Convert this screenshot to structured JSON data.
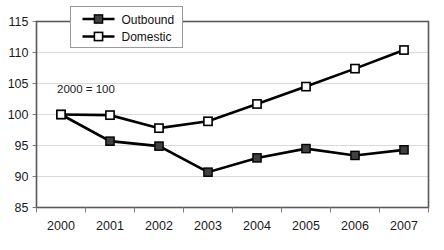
{
  "chart_data": {
    "type": "line",
    "title": "",
    "xlabel": "",
    "ylabel": "",
    "categories": [
      "2000",
      "2001",
      "2002",
      "2003",
      "2004",
      "2005",
      "2006",
      "2007"
    ],
    "ylim": [
      85,
      115
    ],
    "y_ticks": [
      85,
      90,
      95,
      100,
      105,
      110,
      115
    ],
    "y_tick_labels": [
      "85",
      "90",
      "95",
      "100",
      "105",
      "110",
      "115"
    ],
    "grid": true,
    "legend_position": "top-center",
    "annotations": [
      {
        "text": "2000 = 100",
        "x_value": "2000",
        "y_value": 103.5
      }
    ],
    "series": [
      {
        "name": "Outbound",
        "marker": "filled-square",
        "marker_color": "#404040",
        "line_color": "#000000",
        "values": [
          100.0,
          95.7,
          94.9,
          90.7,
          93.0,
          94.5,
          93.4,
          94.3
        ]
      },
      {
        "name": "Domestic",
        "marker": "open-square",
        "marker_color": "#ffffff",
        "line_color": "#000000",
        "values": [
          100.0,
          99.9,
          97.8,
          98.9,
          101.7,
          104.5,
          107.4,
          110.4
        ]
      }
    ]
  },
  "legend": {
    "items": [
      {
        "label": "Outbound"
      },
      {
        "label": "Domestic"
      }
    ]
  },
  "colors": {
    "gridline": "#d9d9d9",
    "axis": "#595959",
    "line": "#000000",
    "outbound_marker": "#404040",
    "domestic_marker": "#ffffff",
    "background": "#ffffff"
  }
}
